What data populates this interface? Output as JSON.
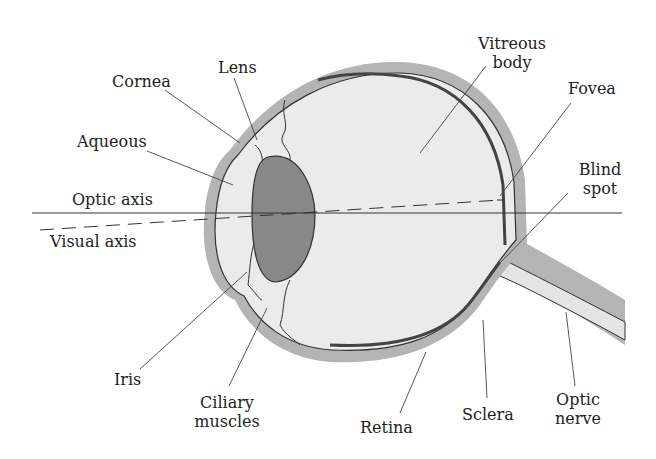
{
  "diagram": {
    "colors": {
      "sclera": "#b4b4b4",
      "interior": "#ebebeb",
      "lens": "#888888",
      "outline": "#333333",
      "leader": "#444444",
      "background": "#ffffff"
    },
    "labels": {
      "cornea": "Cornea",
      "lens": "Lens",
      "aqueous": "Aqueous",
      "optic_axis": "Optic axis",
      "visual_axis": "Visual axis",
      "iris": "Iris",
      "ciliary_1": "Ciliary",
      "ciliary_2": "muscles",
      "vitreous_1": "Vitreous",
      "vitreous_2": "body",
      "fovea": "Fovea",
      "blind_1": "Blind",
      "blind_2": "spot",
      "retina": "Retina",
      "sclera": "Sclera",
      "optic_nerve_1": "Optic",
      "optic_nerve_2": "nerve"
    }
  }
}
